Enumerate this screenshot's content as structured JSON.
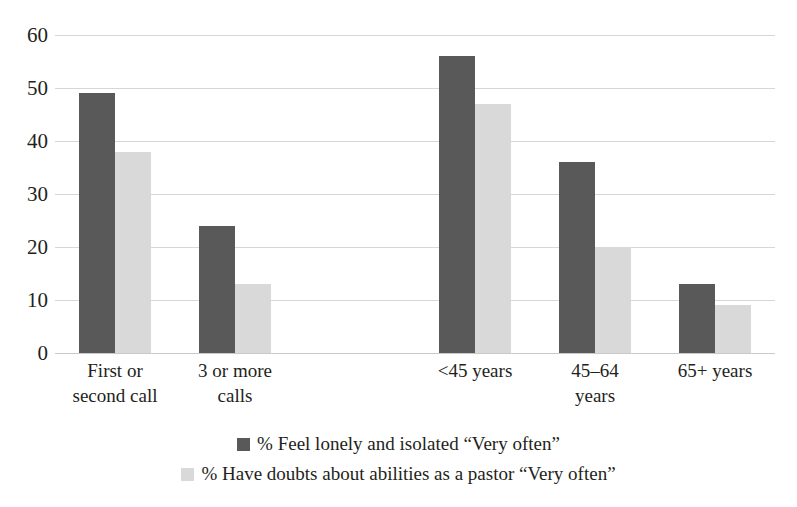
{
  "chart_data": {
    "type": "bar",
    "title": "",
    "xlabel": "",
    "ylabel": "",
    "ylim": [
      0,
      60
    ],
    "ytick_step": 10,
    "yticks": [
      0,
      10,
      20,
      30,
      40,
      50,
      60
    ],
    "grid": true,
    "legend_position": "bottom",
    "categories": [
      "First or second call",
      "3 or more calls",
      "",
      "<45 years",
      "45–64 years",
      "65+ years"
    ],
    "series": [
      {
        "name": "% Feel lonely and isolated “Very often”",
        "color": "#595959",
        "values": [
          49,
          24,
          null,
          56,
          36,
          13
        ]
      },
      {
        "name": "% Have doubts about abilities as a pastor “Very often”",
        "color": "#d9d9d9",
        "values": [
          38,
          13,
          null,
          47,
          20,
          9
        ]
      }
    ]
  },
  "axis": {
    "y_tick_labels": [
      "60",
      "50",
      "40",
      "30",
      "20",
      "10",
      "0"
    ],
    "x_category_lines": [
      [
        "First or",
        "second call"
      ],
      [
        "3 or more",
        "calls"
      ],
      [
        ""
      ],
      [
        "<45 years"
      ],
      [
        "45–64",
        "years"
      ],
      [
        "65+ years"
      ]
    ]
  },
  "legend": {
    "items": [
      {
        "label": "% Feel lonely and isolated “Very often”",
        "color": "#595959"
      },
      {
        "label": "% Have doubts about abilities as a pastor “Very often”",
        "color": "#d9d9d9"
      }
    ]
  },
  "colors": {
    "series_dark": "#595959",
    "series_light": "#d9d9d9",
    "gridline": "#d6d6d6",
    "text": "#231f20",
    "background": "#ffffff"
  }
}
